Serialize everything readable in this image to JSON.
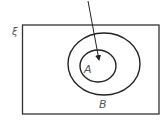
{
  "diagram": {
    "type": "venn",
    "universal_set_symbol": "ξ",
    "sets": [
      {
        "label": "A",
        "relation": "subset of B"
      },
      {
        "label": "B"
      }
    ],
    "arrow": {
      "points_to": "A"
    },
    "colors": {
      "stroke": "#222222",
      "label": "#555555",
      "background": "#ffffff"
    }
  }
}
